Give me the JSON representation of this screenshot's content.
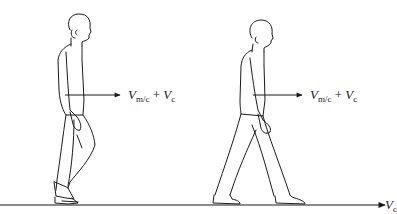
{
  "figure": {
    "colors": {
      "stroke": "#1a1a1a",
      "background": "#ffffff"
    },
    "people": [
      {
        "label": {
          "main": "V",
          "sub": "m/c",
          "plus": "+",
          "main2": "V",
          "sub2": "c"
        }
      },
      {
        "label": {
          "main": "V",
          "sub": "m/c",
          "plus": "+",
          "main2": "V",
          "sub2": "c"
        }
      }
    ],
    "ground": {
      "label": {
        "main": "V",
        "sub": "c"
      }
    }
  }
}
